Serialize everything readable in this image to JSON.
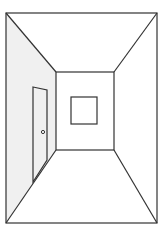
{
  "diagram": {
    "kind": "one-point perspective hallway",
    "colors": {
      "background": "#ffffff",
      "line": "#333333",
      "left_wall_fill": "#f0f0f0",
      "door_fill": "#f0f0f0"
    },
    "outer_frame": {
      "x1": 6,
      "y1": 13,
      "x2": 157,
      "y2": 223
    },
    "back_wall": {
      "x1": 56,
      "y1": 72,
      "x2": 114,
      "y2": 150
    },
    "window": {
      "x1": 71,
      "y1": 97,
      "x2": 97,
      "y2": 124
    },
    "door": {
      "top_left": [
        33,
        87
      ],
      "top_right": [
        47,
        90
      ],
      "bottom_right": [
        47,
        160
      ],
      "bottom_left": [
        33,
        182
      ],
      "knob": [
        43,
        132
      ]
    }
  }
}
